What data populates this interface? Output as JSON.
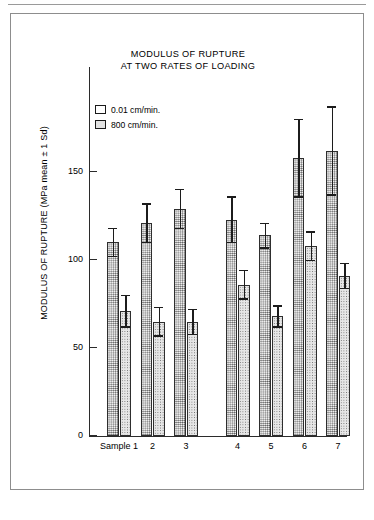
{
  "figure": {
    "title_line1": "MODULUS OF RUPTURE",
    "title_line2": "AT TWO RATES OF LOADING",
    "ylabel": "MODULUS OF RUPTURE (MPa mean ± 1 Sd)",
    "sample_prefix": "Sample"
  },
  "chart_data": {
    "type": "bar",
    "title": "MODULUS OF RUPTURE AT TWO RATES OF LOADING",
    "xlabel": "",
    "ylabel": "MODULUS OF RUPTURE (MPa mean ± 1 Sd)",
    "ylim": [
      0,
      190
    ],
    "yticks": [
      0,
      50,
      100,
      150
    ],
    "ytick_labels": [
      "0",
      "50",
      "100",
      "150"
    ],
    "grid": false,
    "legend_position": "upper-left",
    "categories": [
      "Sample 1",
      "2",
      "3",
      "4",
      "5",
      "6",
      "7"
    ],
    "series": [
      {
        "name": "0.01 cm/min.",
        "fill": "light-stipple",
        "values": [
          110,
          121,
          129,
          123,
          114,
          158,
          162
        ],
        "errors": [
          8,
          11,
          11,
          13,
          7,
          22,
          25
        ]
      },
      {
        "name": "800 cm/min.",
        "fill": "dense-stipple",
        "values": [
          71,
          65,
          65,
          86,
          68,
          108,
          91
        ],
        "errors": [
          9,
          8,
          7,
          8,
          6,
          8,
          7
        ]
      }
    ]
  },
  "legend": {
    "items": [
      {
        "label": "0.01 cm/min.",
        "swatch": "plain"
      },
      {
        "label": "800  cm/min.",
        "swatch": "stipple"
      }
    ]
  },
  "axis": {
    "ytick_labels": [
      "150",
      "100",
      "50",
      "0"
    ],
    "xtick_labels": [
      "Sample 1",
      "2",
      "3",
      "4",
      "5",
      "6",
      "7"
    ]
  },
  "colors": {
    "ink": "#1c1c1c",
    "frame": "#8d8d8d",
    "bar_a": "#f0f0f0",
    "bar_b": "#e6e6e6"
  }
}
